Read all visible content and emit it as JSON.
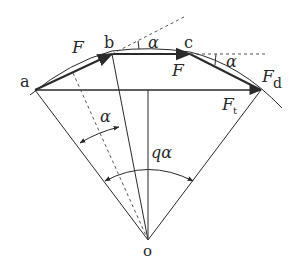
{
  "diagram": {
    "type": "geometry-force-diagram",
    "points": {
      "a": {
        "label": "a"
      },
      "b": {
        "label": "b"
      },
      "c": {
        "label": "c"
      },
      "d": {
        "label": "d"
      },
      "o": {
        "label": "o"
      }
    },
    "labels": {
      "force_ab": "F",
      "force_bc": "F",
      "force_d": "F",
      "force_d_sub": "d",
      "force_t": "F",
      "force_t_sub": "t",
      "angle_b": "α",
      "angle_c": "α",
      "angle_left": "α",
      "angle_center": "qα"
    },
    "colors": {
      "line": "#2a2a2a",
      "background": "#ffffff"
    }
  }
}
